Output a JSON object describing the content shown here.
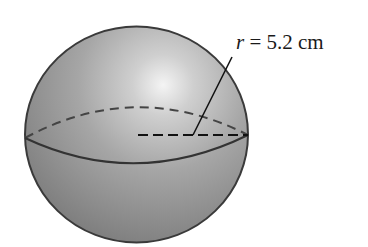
{
  "figure": {
    "type": "sphere-diagram",
    "radius_label": {
      "variable": "r",
      "equals": " = ",
      "value": "5.2",
      "unit": " cm"
    },
    "colors": {
      "sphere_light": "#f2f2f2",
      "sphere_mid": "#a8a8a8",
      "sphere_dark": "#7a7a7a",
      "outline": "#3a3a3a",
      "line": "#111111"
    }
  }
}
